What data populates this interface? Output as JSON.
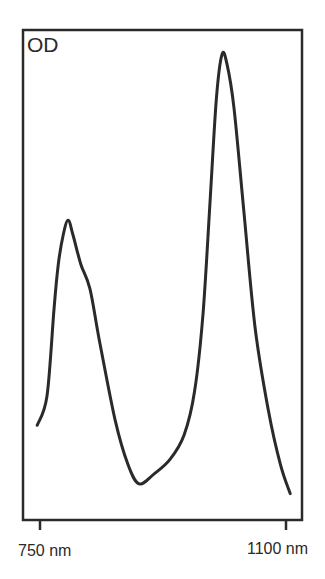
{
  "chart_data": {
    "type": "line",
    "title": "",
    "xlabel": "",
    "ylabel": "OD",
    "x_ticks": [
      {
        "value": 750,
        "label": "750 nm"
      },
      {
        "value": 1100,
        "label": "1100 nm"
      }
    ],
    "xlim": [
      720,
      1115
    ],
    "ylim": [
      0,
      1
    ],
    "grid": false,
    "legend": null,
    "series": [
      {
        "name": "absorption spectrum",
        "color": "#2a2a2a",
        "x": [
          746,
          760,
          770,
          776,
          783,
          790,
          797,
          808,
          821,
          835,
          857,
          875,
          891,
          912,
          935,
          955,
          970,
          982,
          992,
          1001,
          1009,
          1016,
          1026,
          1040,
          1056,
          1075,
          1092,
          1106
        ],
        "y": [
          0.19,
          0.25,
          0.43,
          0.52,
          0.58,
          0.61,
          0.58,
          0.52,
          0.47,
          0.36,
          0.2,
          0.11,
          0.07,
          0.09,
          0.12,
          0.17,
          0.26,
          0.42,
          0.65,
          0.86,
          0.95,
          0.93,
          0.84,
          0.63,
          0.39,
          0.22,
          0.11,
          0.05
        ]
      }
    ]
  },
  "labels": {
    "y_axis": "OD",
    "x_tick_left": "750 nm",
    "x_tick_right": "1100 nm"
  },
  "style": {
    "line_color": "#2a2a2a",
    "frame_color": "#2a2a2a",
    "background": "#ffffff"
  }
}
